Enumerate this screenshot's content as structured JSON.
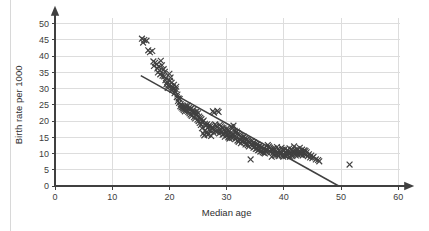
{
  "chart_data": {
    "type": "scatter",
    "title": "",
    "xlabel": "Median age",
    "ylabel": "Birth rate per 1000",
    "xlim": [
      0,
      60
    ],
    "ylim": [
      0,
      50
    ],
    "xticks": [
      0,
      10,
      20,
      30,
      40,
      50,
      60
    ],
    "yticks": [
      0,
      5,
      10,
      15,
      20,
      25,
      30,
      35,
      40,
      45,
      50
    ],
    "xtick_labels": [
      "0",
      "10",
      "20",
      "30",
      "40",
      "50",
      "60"
    ],
    "ytick_labels": [
      "0",
      "5",
      "10",
      "15",
      "20",
      "25",
      "30",
      "35",
      "40",
      "45",
      "50"
    ],
    "grid": true,
    "legend": false,
    "marker": "x",
    "marker_color": "#404040",
    "grid_color": "#dddddd",
    "axis_color": "#404040",
    "background_color": "#ffffff",
    "axis_arrows": true,
    "trend_line": {
      "label": "line of best fit",
      "color": "#404040",
      "x_start": 15.0,
      "y_start": 34.0,
      "x_end": 49.6,
      "y_end": 0.0
    },
    "points": [
      [
        15.2,
        45.4
      ],
      [
        15.6,
        45.0
      ],
      [
        15.4,
        44.2
      ],
      [
        16.0,
        44.8
      ],
      [
        16.3,
        41.8
      ],
      [
        16.6,
        41.2
      ],
      [
        17.0,
        41.6
      ],
      [
        17.2,
        38.4
      ],
      [
        17.5,
        38.0
      ],
      [
        17.3,
        37.0
      ],
      [
        17.8,
        37.6
      ],
      [
        17.9,
        36.2
      ],
      [
        18.1,
        36.8
      ],
      [
        18.3,
        35.6
      ],
      [
        18.0,
        35.0
      ],
      [
        18.5,
        38.6
      ],
      [
        18.7,
        37.2
      ],
      [
        18.4,
        34.4
      ],
      [
        18.8,
        34.0
      ],
      [
        19.0,
        36.0
      ],
      [
        19.2,
        35.2
      ],
      [
        19.1,
        33.8
      ],
      [
        19.4,
        33.2
      ],
      [
        19.3,
        32.6
      ],
      [
        19.6,
        32.0
      ],
      [
        19.5,
        31.4
      ],
      [
        19.8,
        31.0
      ],
      [
        19.7,
        30.2
      ],
      [
        20.0,
        34.6
      ],
      [
        20.2,
        33.4
      ],
      [
        20.1,
        32.4
      ],
      [
        20.4,
        31.8
      ],
      [
        20.3,
        30.8
      ],
      [
        20.6,
        30.4
      ],
      [
        20.5,
        29.6
      ],
      [
        20.8,
        31.2
      ],
      [
        20.7,
        30.0
      ],
      [
        21.0,
        29.2
      ],
      [
        20.9,
        28.6
      ],
      [
        21.2,
        30.6
      ],
      [
        21.1,
        29.8
      ],
      [
        21.4,
        28.2
      ],
      [
        21.3,
        27.4
      ],
      [
        21.6,
        27.0
      ],
      [
        21.5,
        26.2
      ],
      [
        21.8,
        26.8
      ],
      [
        21.7,
        25.6
      ],
      [
        22.0,
        25.2
      ],
      [
        21.9,
        24.6
      ],
      [
        22.2,
        24.8
      ],
      [
        22.1,
        24.2
      ],
      [
        22.4,
        24.4
      ],
      [
        22.3,
        23.8
      ],
      [
        22.6,
        24.0
      ],
      [
        22.5,
        23.4
      ],
      [
        22.8,
        24.6
      ],
      [
        22.7,
        23.0
      ],
      [
        23.0,
        24.2
      ],
      [
        22.9,
        23.6
      ],
      [
        23.2,
        24.8
      ],
      [
        23.1,
        23.2
      ],
      [
        23.4,
        24.0
      ],
      [
        23.3,
        22.8
      ],
      [
        23.6,
        23.6
      ],
      [
        23.5,
        22.4
      ],
      [
        23.8,
        23.8
      ],
      [
        23.7,
        22.0
      ],
      [
        24.0,
        23.2
      ],
      [
        23.9,
        21.6
      ],
      [
        24.2,
        23.4
      ],
      [
        24.1,
        22.6
      ],
      [
        24.4,
        22.8
      ],
      [
        24.3,
        21.2
      ],
      [
        24.6,
        22.2
      ],
      [
        24.5,
        20.8
      ],
      [
        24.8,
        23.0
      ],
      [
        24.7,
        21.8
      ],
      [
        25.0,
        22.4
      ],
      [
        24.9,
        20.4
      ],
      [
        25.2,
        21.4
      ],
      [
        25.1,
        20.0
      ],
      [
        25.4,
        21.0
      ],
      [
        25.3,
        19.4
      ],
      [
        25.6,
        20.6
      ],
      [
        25.5,
        18.8
      ],
      [
        25.8,
        19.8
      ],
      [
        25.7,
        17.8
      ],
      [
        26.0,
        20.2
      ],
      [
        25.9,
        16.2
      ],
      [
        26.2,
        19.2
      ],
      [
        26.1,
        15.6
      ],
      [
        26.4,
        18.6
      ],
      [
        26.3,
        17.2
      ],
      [
        26.6,
        19.0
      ],
      [
        26.5,
        16.6
      ],
      [
        26.8,
        18.2
      ],
      [
        26.7,
        15.8
      ],
      [
        27.0,
        18.8
      ],
      [
        26.9,
        16.0
      ],
      [
        27.2,
        18.4
      ],
      [
        27.1,
        17.0
      ],
      [
        27.4,
        17.6
      ],
      [
        27.3,
        15.4
      ],
      [
        27.6,
        23.0
      ],
      [
        27.8,
        22.6
      ],
      [
        27.5,
        18.0
      ],
      [
        27.7,
        16.4
      ],
      [
        28.0,
        19.0
      ],
      [
        27.9,
        17.4
      ],
      [
        28.2,
        18.6
      ],
      [
        28.1,
        16.8
      ],
      [
        28.4,
        23.2
      ],
      [
        28.6,
        22.8
      ],
      [
        28.3,
        18.2
      ],
      [
        28.5,
        17.0
      ],
      [
        28.8,
        18.8
      ],
      [
        28.7,
        16.2
      ],
      [
        29.0,
        18.4
      ],
      [
        28.9,
        17.2
      ],
      [
        29.2,
        18.0
      ],
      [
        29.1,
        16.6
      ],
      [
        29.4,
        17.8
      ],
      [
        29.3,
        15.8
      ],
      [
        29.6,
        17.4
      ],
      [
        29.5,
        16.0
      ],
      [
        29.8,
        17.0
      ],
      [
        29.7,
        15.2
      ],
      [
        30.0,
        17.6
      ],
      [
        29.9,
        16.4
      ],
      [
        30.2,
        17.2
      ],
      [
        30.1,
        15.6
      ],
      [
        30.4,
        16.8
      ],
      [
        30.3,
        15.0
      ],
      [
        30.6,
        16.2
      ],
      [
        30.5,
        14.6
      ],
      [
        30.8,
        18.2
      ],
      [
        30.7,
        15.4
      ],
      [
        31.0,
        17.8
      ],
      [
        30.9,
        14.8
      ],
      [
        31.2,
        18.6
      ],
      [
        31.1,
        16.0
      ],
      [
        31.4,
        17.0
      ],
      [
        31.3,
        15.2
      ],
      [
        31.6,
        16.4
      ],
      [
        31.5,
        14.4
      ],
      [
        31.8,
        16.8
      ],
      [
        31.7,
        15.0
      ],
      [
        32.0,
        16.2
      ],
      [
        31.9,
        14.0
      ],
      [
        32.2,
        15.8
      ],
      [
        32.1,
        13.6
      ],
      [
        32.4,
        15.4
      ],
      [
        32.3,
        14.2
      ],
      [
        32.6,
        15.0
      ],
      [
        32.5,
        13.2
      ],
      [
        32.8,
        14.8
      ],
      [
        32.7,
        13.8
      ],
      [
        33.0,
        15.2
      ],
      [
        32.9,
        14.0
      ],
      [
        33.2,
        14.6
      ],
      [
        33.1,
        13.4
      ],
      [
        33.4,
        14.2
      ],
      [
        33.3,
        12.8
      ],
      [
        33.6,
        14.4
      ],
      [
        33.5,
        13.0
      ],
      [
        33.8,
        14.0
      ],
      [
        33.7,
        12.6
      ],
      [
        34.0,
        13.6
      ],
      [
        33.9,
        12.2
      ],
      [
        34.2,
        8.2
      ],
      [
        34.4,
        13.8
      ],
      [
        34.6,
        13.2
      ],
      [
        34.5,
        12.4
      ],
      [
        34.8,
        13.4
      ],
      [
        34.7,
        11.8
      ],
      [
        35.0,
        13.0
      ],
      [
        34.9,
        12.0
      ],
      [
        35.2,
        12.6
      ],
      [
        35.1,
        11.4
      ],
      [
        35.4,
        12.8
      ],
      [
        35.3,
        11.6
      ],
      [
        35.6,
        12.2
      ],
      [
        35.5,
        11.0
      ],
      [
        35.8,
        12.4
      ],
      [
        35.7,
        11.2
      ],
      [
        36.0,
        11.8
      ],
      [
        35.9,
        10.6
      ],
      [
        36.2,
        12.0
      ],
      [
        36.1,
        10.8
      ],
      [
        36.4,
        11.4
      ],
      [
        36.3,
        10.4
      ],
      [
        36.6,
        11.6
      ],
      [
        36.5,
        10.2
      ],
      [
        36.8,
        11.0
      ],
      [
        36.7,
        10.0
      ],
      [
        37.0,
        11.2
      ],
      [
        36.9,
        10.6
      ],
      [
        37.2,
        12.6
      ],
      [
        37.4,
        12.2
      ],
      [
        37.6,
        11.8
      ],
      [
        37.5,
        10.8
      ],
      [
        37.8,
        11.4
      ],
      [
        37.7,
        10.4
      ],
      [
        38.0,
        11.0
      ],
      [
        37.9,
        9.0
      ],
      [
        38.2,
        11.6
      ],
      [
        38.1,
        10.2
      ],
      [
        38.4,
        11.2
      ],
      [
        38.3,
        9.8
      ],
      [
        38.6,
        10.8
      ],
      [
        38.5,
        9.4
      ],
      [
        38.8,
        12.0
      ],
      [
        38.7,
        10.0
      ],
      [
        39.0,
        11.4
      ],
      [
        38.9,
        9.6
      ],
      [
        39.2,
        11.0
      ],
      [
        39.1,
        9.2
      ],
      [
        39.4,
        10.6
      ],
      [
        39.3,
        9.8
      ],
      [
        39.6,
        11.8
      ],
      [
        39.5,
        10.2
      ],
      [
        39.8,
        11.2
      ],
      [
        39.7,
        9.4
      ],
      [
        40.0,
        10.8
      ],
      [
        39.9,
        9.0
      ],
      [
        40.2,
        11.4
      ],
      [
        40.1,
        9.6
      ],
      [
        40.4,
        10.4
      ],
      [
        40.3,
        9.2
      ],
      [
        40.6,
        11.0
      ],
      [
        40.5,
        9.8
      ],
      [
        40.8,
        10.6
      ],
      [
        40.7,
        9.4
      ],
      [
        41.0,
        11.6
      ],
      [
        40.9,
        10.0
      ],
      [
        41.2,
        10.2
      ],
      [
        41.1,
        9.0
      ],
      [
        41.4,
        11.2
      ],
      [
        41.3,
        9.6
      ],
      [
        41.6,
        10.8
      ],
      [
        41.5,
        9.2
      ],
      [
        41.8,
        12.2
      ],
      [
        41.7,
        10.4
      ],
      [
        42.0,
        11.0
      ],
      [
        41.9,
        9.8
      ],
      [
        42.2,
        10.6
      ],
      [
        42.1,
        9.4
      ],
      [
        42.4,
        11.4
      ],
      [
        42.3,
        10.0
      ],
      [
        42.6,
        10.2
      ],
      [
        42.5,
        9.6
      ],
      [
        42.8,
        11.8
      ],
      [
        42.7,
        10.8
      ],
      [
        43.0,
        10.4
      ],
      [
        42.9,
        9.8
      ],
      [
        43.2,
        11.2
      ],
      [
        43.1,
        10.0
      ],
      [
        43.4,
        10.6
      ],
      [
        43.3,
        9.4
      ],
      [
        43.6,
        11.0
      ],
      [
        43.5,
        10.2
      ],
      [
        43.8,
        10.8
      ],
      [
        43.7,
        9.8
      ],
      [
        44.0,
        10.4
      ],
      [
        43.9,
        9.6
      ],
      [
        44.2,
        9.2
      ],
      [
        44.4,
        9.8
      ],
      [
        44.6,
        8.8
      ],
      [
        44.8,
        9.4
      ],
      [
        45.0,
        8.6
      ],
      [
        45.2,
        9.0
      ],
      [
        45.6,
        8.2
      ],
      [
        46.0,
        8.0
      ],
      [
        46.2,
        7.6
      ],
      [
        51.5,
        6.6
      ]
    ],
    "outliers": [
      {
        "x": 51.5,
        "y": 6.6,
        "note": "isolated far-right point"
      },
      {
        "x": 34.2,
        "y": 8.2,
        "note": "below main trend"
      }
    ],
    "n_points": 265,
    "correlation": "strong negative"
  }
}
